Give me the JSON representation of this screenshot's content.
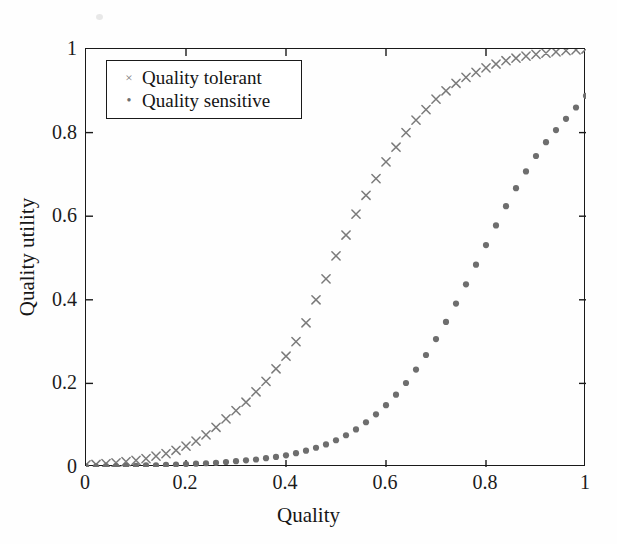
{
  "figure": {
    "background_color": "#ffffff",
    "axis_color": "#1a1a1a",
    "xlabel": "Quality",
    "ylabel": "Quality utility"
  },
  "legend": {
    "position": "top-left-inside",
    "border_color": "#1a1a1a",
    "entries": [
      {
        "label": "Quality tolerant",
        "marker": "x",
        "marker_glyph": "×",
        "color": "#7b7b7b"
      },
      {
        "label": "Quality sensitive",
        "marker": "dot",
        "marker_glyph": "•",
        "color": "#6e6e6e"
      }
    ]
  },
  "chart_data": {
    "type": "scatter",
    "title": "",
    "xlabel": "Quality",
    "ylabel": "Quality utility",
    "xlim": [
      0,
      1
    ],
    "ylim": [
      0,
      1
    ],
    "xticks": [
      0,
      0.2,
      0.4,
      0.6,
      0.8,
      1
    ],
    "xtick_labels": [
      "0",
      "0.2",
      "0.4",
      "0.6",
      "0.8",
      "1"
    ],
    "yticks": [
      0,
      0.2,
      0.4,
      0.6,
      0.8,
      1
    ],
    "ytick_labels": [
      "0",
      "0.2",
      "0.4",
      "0.6",
      "0.8",
      "1"
    ],
    "grid": false,
    "legend_position": "upper left",
    "x": [
      0,
      0.02,
      0.04,
      0.06,
      0.08,
      0.1,
      0.12,
      0.14,
      0.16,
      0.18,
      0.2,
      0.22,
      0.24,
      0.26,
      0.28,
      0.3,
      0.32,
      0.34,
      0.36,
      0.38,
      0.4,
      0.42,
      0.44,
      0.46,
      0.48,
      0.5,
      0.52,
      0.54,
      0.56,
      0.58,
      0.6,
      0.62,
      0.64,
      0.66,
      0.68,
      0.7,
      0.72,
      0.74,
      0.76,
      0.78,
      0.8,
      0.82,
      0.84,
      0.86,
      0.88,
      0.9,
      0.92,
      0.94,
      0.96,
      0.98,
      1
    ],
    "series": [
      {
        "name": "Quality tolerant",
        "marker": "x",
        "color": "#7b7b7b",
        "values": [
          0.005,
          0.006,
          0.008,
          0.01,
          0.013,
          0.016,
          0.02,
          0.026,
          0.032,
          0.04,
          0.05,
          0.062,
          0.077,
          0.095,
          0.115,
          0.135,
          0.155,
          0.18,
          0.205,
          0.235,
          0.265,
          0.3,
          0.345,
          0.4,
          0.45,
          0.505,
          0.555,
          0.605,
          0.65,
          0.69,
          0.73,
          0.765,
          0.8,
          0.83,
          0.855,
          0.88,
          0.9,
          0.918,
          0.932,
          0.944,
          0.955,
          0.964,
          0.972,
          0.978,
          0.983,
          0.987,
          0.99,
          0.993,
          0.996,
          0.998,
          1.0
        ]
      },
      {
        "name": "Quality sensitive",
        "marker": "dot",
        "color": "#6e6e6e",
        "values": [
          0.001,
          0.001,
          0.002,
          0.002,
          0.003,
          0.003,
          0.004,
          0.004,
          0.005,
          0.006,
          0.007,
          0.008,
          0.009,
          0.01,
          0.012,
          0.014,
          0.016,
          0.018,
          0.021,
          0.024,
          0.028,
          0.033,
          0.039,
          0.046,
          0.054,
          0.064,
          0.076,
          0.09,
          0.107,
          0.126,
          0.148,
          0.173,
          0.201,
          0.233,
          0.268,
          0.306,
          0.347,
          0.391,
          0.437,
          0.484,
          0.531,
          0.578,
          0.624,
          0.667,
          0.707,
          0.744,
          0.777,
          0.806,
          0.833,
          0.86,
          0.888
        ]
      }
    ]
  }
}
